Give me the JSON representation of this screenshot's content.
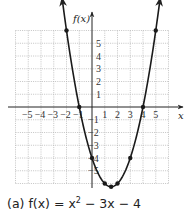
{
  "chart_data": {
    "type": "line",
    "title": "",
    "function": "f(x) = x^2 - 3x - 4",
    "caption": {
      "label": "(a)",
      "lhs": "f(x)",
      "equals": "=",
      "rhs_x": "x",
      "rhs_exp": "2",
      "rhs_rest": "− 3x − 4"
    },
    "xlabel": "x",
    "ylabel": "f(x)",
    "xlim": [
      -6,
      6
    ],
    "ylim": [
      -6,
      6
    ],
    "grid": true,
    "x_ticks": [
      "−5",
      "−4",
      "−3",
      "−2",
      "−1",
      "1",
      "2",
      "3",
      "4",
      "5"
    ],
    "y_ticks": [
      "5",
      "4",
      "3",
      "2",
      "1",
      "−1",
      "−2",
      "−3",
      "−4",
      "−5"
    ],
    "points": [
      {
        "x": -2,
        "y": 6
      },
      {
        "x": -1,
        "y": 0
      },
      {
        "x": 0,
        "y": -4
      },
      {
        "x": 1,
        "y": -6
      },
      {
        "x": 1.5,
        "y": -6.25
      },
      {
        "x": 2,
        "y": -6
      },
      {
        "x": 3,
        "y": -4
      },
      {
        "x": 4,
        "y": 0
      },
      {
        "x": 5,
        "y": 6
      }
    ],
    "series": [
      {
        "name": "f(x) = x^2 - 3x - 4",
        "x": [
          -2,
          -1,
          0,
          1,
          1.5,
          2,
          3,
          4,
          5
        ],
        "values": [
          6,
          0,
          -4,
          -6,
          -6.25,
          -6,
          -4,
          0,
          6
        ]
      }
    ],
    "colors": {
      "curve": "#1a1a1a",
      "grid": "#b5b5b5",
      "axis": "#222222"
    }
  }
}
